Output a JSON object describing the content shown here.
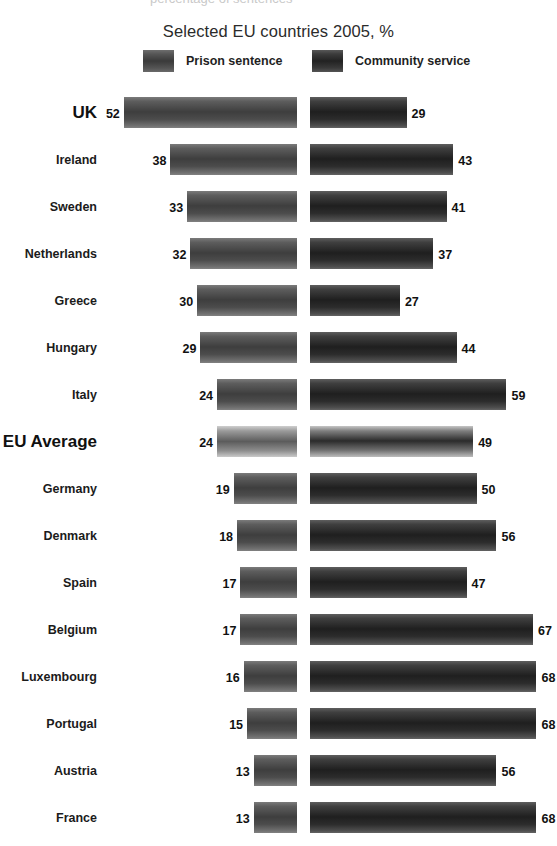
{
  "page": {
    "clipped_top_text": "percentage of sentences"
  },
  "chart_data": {
    "type": "bar",
    "title": "Selected EU countries 2005, %",
    "xlabel": "",
    "ylabel": "",
    "orientation": "horizontal-diverging",
    "grid": false,
    "legend_position": "top-center",
    "value_unit": "%",
    "xlim": [
      0,
      70
    ],
    "legend": [
      "Prison sentence",
      "Community service"
    ],
    "categories": [
      "UK",
      "Ireland",
      "Sweden",
      "Netherlands",
      "Greece",
      "Hungary",
      "Italy",
      "EU Average",
      "Germany",
      "Denmark",
      "Spain",
      "Belgium",
      "Luxembourg",
      "Portugal",
      "Austria",
      "France"
    ],
    "emphasized_categories": [
      "UK",
      "EU Average"
    ],
    "series": [
      {
        "name": "Prison sentence",
        "side": "left",
        "color": "#3e3e3e",
        "values": [
          52,
          38,
          33,
          32,
          30,
          29,
          24,
          24,
          19,
          18,
          17,
          17,
          16,
          15,
          13,
          13
        ]
      },
      {
        "name": "Community service",
        "side": "right",
        "color": "#1f1f1f",
        "values": [
          29,
          43,
          41,
          37,
          27,
          44,
          59,
          49,
          50,
          56,
          47,
          67,
          68,
          68,
          56,
          68
        ]
      }
    ]
  },
  "layout": {
    "label_right_edge": 97,
    "left_axis_x": 297,
    "right_axis_x": 310,
    "px_per_unit": 3.33,
    "row_pitch": 47,
    "first_row_top": 97,
    "bar_height": 31
  }
}
